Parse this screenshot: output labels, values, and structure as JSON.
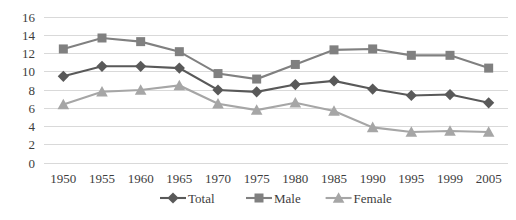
{
  "chart_data": {
    "type": "line",
    "title": "",
    "subtitle": "",
    "xlabel": "",
    "ylabel": "",
    "categories": [
      "1950",
      "1955",
      "1960",
      "1965",
      "1970",
      "1975",
      "1980",
      "1985",
      "1990",
      "1995",
      "1999",
      "2005"
    ],
    "ylim": [
      0,
      16
    ],
    "ytick_values": [
      "0",
      "2",
      "4",
      "6",
      "8",
      "10",
      "12",
      "14",
      "16"
    ],
    "grid": "horizontal-only",
    "legend_position": "bottom",
    "series": [
      {
        "name": "Total",
        "marker": "diamond",
        "color": "#595959",
        "values": [
          9.5,
          10.6,
          10.6,
          10.4,
          8.0,
          7.8,
          8.6,
          9.0,
          8.1,
          7.4,
          7.5,
          6.6
        ]
      },
      {
        "name": "Male",
        "marker": "square",
        "color": "#808080",
        "values": [
          12.5,
          13.7,
          13.3,
          12.2,
          9.8,
          9.2,
          10.8,
          12.4,
          12.5,
          11.8,
          11.8,
          10.4
        ]
      },
      {
        "name": "Female",
        "marker": "triangle",
        "color": "#a6a6a6",
        "values": [
          6.4,
          7.8,
          8.0,
          8.5,
          6.5,
          5.8,
          6.6,
          5.7,
          3.9,
          3.4,
          3.5,
          3.4
        ]
      }
    ]
  },
  "legend": {
    "items": [
      {
        "label": "Total"
      },
      {
        "label": "Male"
      },
      {
        "label": "Female"
      }
    ]
  },
  "axes": {
    "y_max_label": "16",
    "y_min_label": "0"
  }
}
